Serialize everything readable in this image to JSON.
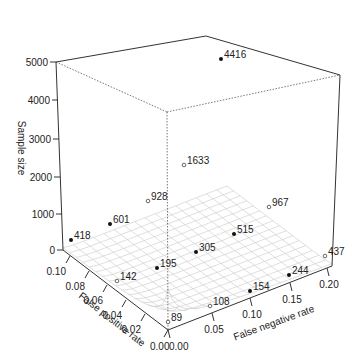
{
  "chart_data": {
    "type": "surface3d",
    "title": "",
    "xlabel": "False negative rate",
    "ylabel": "False positive rate",
    "zlabel": "Sample size",
    "x_ticks": [
      "0.00",
      "0.05",
      "0.10",
      "0.15",
      "0.20"
    ],
    "y_ticks": [
      "0.00",
      "0.02",
      "0.04",
      "0.06",
      "0.08",
      "0.10"
    ],
    "z_ticks": [
      "0",
      "1000",
      "2000",
      "3000",
      "4000",
      "5000"
    ],
    "xlim": [
      0,
      0.2
    ],
    "ylim": [
      0,
      0.1
    ],
    "zlim": [
      0,
      5000
    ],
    "grid": false,
    "legend": null,
    "surface": "wireframe mesh, light gray, sample size increasing sharply toward low error rates",
    "points": [
      {
        "label": "4416",
        "fnr": 0.0,
        "fpr": 0.0,
        "filled": true
      },
      {
        "label": "1633",
        "fnr": 0.05,
        "fpr": 0.025,
        "filled": false
      },
      {
        "label": "928",
        "fnr": 0.025,
        "fpr": 0.05,
        "filled": false
      },
      {
        "label": "601",
        "fnr": 0.05,
        "fpr": 0.08,
        "filled": true
      },
      {
        "label": "418",
        "fnr": 0.0,
        "fpr": 0.1,
        "filled": true
      },
      {
        "label": "967",
        "fnr": 0.2,
        "fpr": 0.025,
        "filled": false
      },
      {
        "label": "515",
        "fnr": 0.15,
        "fpr": 0.05,
        "filled": true
      },
      {
        "label": "305",
        "fnr": 0.1,
        "fpr": 0.05,
        "filled": true
      },
      {
        "label": "195",
        "fnr": 0.05,
        "fpr": 0.05,
        "filled": true
      },
      {
        "label": "142",
        "fnr": 0.0,
        "fpr": 0.05,
        "filled": false
      },
      {
        "label": "89",
        "fnr": 0.0,
        "fpr": 0.0,
        "filled": false
      },
      {
        "label": "108",
        "fnr": 0.05,
        "fpr": 0.0,
        "filled": false
      },
      {
        "label": "154",
        "fnr": 0.1,
        "fpr": 0.0,
        "filled": true
      },
      {
        "label": "244",
        "fnr": 0.15,
        "fpr": 0.0,
        "filled": true
      },
      {
        "label": "437",
        "fnr": 0.2,
        "fpr": 0.0,
        "filled": false
      }
    ]
  },
  "render": {
    "z_ticks": [
      {
        "label": "5000",
        "x": 56,
        "y": 62
      },
      {
        "label": "4000",
        "x": 58,
        "y": 100
      },
      {
        "label": "3000",
        "x": 59,
        "y": 139
      },
      {
        "label": "2000",
        "x": 60,
        "y": 177
      },
      {
        "label": "1000",
        "x": 62,
        "y": 214
      },
      {
        "label": "0",
        "x": 63,
        "y": 250
      }
    ],
    "fpr_ticks": [
      {
        "label": "0.10",
        "x": 70,
        "y": 256
      },
      {
        "label": "0.08",
        "x": 89,
        "y": 271
      },
      {
        "label": "0.06",
        "x": 107,
        "y": 285
      },
      {
        "label": "0.04",
        "x": 126,
        "y": 300
      },
      {
        "label": "0.02",
        "x": 145,
        "y": 314
      }
    ],
    "fnr_ticks": [
      {
        "label": "0.00",
        "x": 168,
        "y": 330
      },
      {
        "label": "0.05",
        "x": 212,
        "y": 313
      },
      {
        "label": "0.10",
        "x": 250,
        "y": 298
      },
      {
        "label": "0.15",
        "x": 290,
        "y": 283
      },
      {
        "label": "0.20",
        "x": 327,
        "y": 268
      }
    ],
    "fpr_zero_label": "0.00",
    "points": [
      {
        "label": "4416",
        "x": 221,
        "y": 59,
        "filled": true
      },
      {
        "label": "1633",
        "x": 184,
        "y": 165,
        "filled": false
      },
      {
        "label": "928",
        "x": 148,
        "y": 201,
        "filled": false
      },
      {
        "label": "601",
        "x": 110,
        "y": 224,
        "filled": true
      },
      {
        "label": "418",
        "x": 71,
        "y": 240,
        "filled": true
      },
      {
        "label": "967",
        "x": 269,
        "y": 207,
        "filled": false
      },
      {
        "label": "515",
        "x": 234,
        "y": 234,
        "filled": true
      },
      {
        "label": "305",
        "x": 196,
        "y": 252,
        "filled": true
      },
      {
        "label": "195",
        "x": 157,
        "y": 268,
        "filled": true
      },
      {
        "label": "142",
        "x": 117,
        "y": 281,
        "filled": false
      },
      {
        "label": "89",
        "x": 168,
        "y": 322,
        "filled": false
      },
      {
        "label": "108",
        "x": 210,
        "y": 306,
        "filled": false
      },
      {
        "label": "154",
        "x": 250,
        "y": 291,
        "filled": true
      },
      {
        "label": "244",
        "x": 289,
        "y": 275,
        "filled": true
      },
      {
        "label": "437",
        "x": 325,
        "y": 256,
        "filled": false
      }
    ],
    "colors": {
      "axis": "#333333",
      "mesh": "#d0d0d0",
      "point": "#111111",
      "text": "#222222"
    }
  }
}
